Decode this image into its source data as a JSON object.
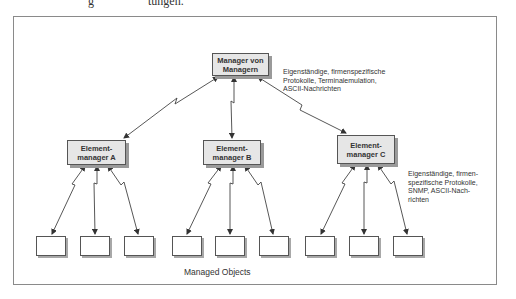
{
  "page_fragment": {
    "left": "g",
    "right": "tungen."
  },
  "diagram": {
    "top_manager": {
      "line1": "Manager von",
      "line2": "Managern"
    },
    "element_managers": [
      {
        "line1": "Element-",
        "line2": "manager A"
      },
      {
        "line1": "Element-",
        "line2": "manager B"
      },
      {
        "line1": "Element-",
        "line2": "manager C"
      }
    ],
    "note_top": "Eigenständige, firmenspezifische\nProtokolle, Terminalemulation,\nASCII-Nachrichten",
    "note_bottom": "Eigenständige, firmen-\nspezifische Protokolle,\nSNMP, ASCII-Nach-\nrichten",
    "managed_objects_label": "Managed Objects",
    "managed_objects_count": 9,
    "colors": {
      "box_fill": "#e6e6e6",
      "border": "#555555",
      "shadow": "#9a9a9a",
      "frame": "#8a8a8a"
    }
  }
}
